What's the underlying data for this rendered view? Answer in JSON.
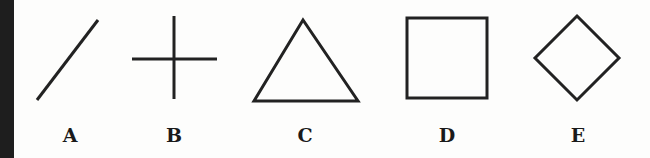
{
  "figure": {
    "stroke_color": "#222222",
    "shapes": [
      {
        "label": "A",
        "shape": "diagonal-line"
      },
      {
        "label": "B",
        "shape": "cross"
      },
      {
        "label": "C",
        "shape": "triangle"
      },
      {
        "label": "D",
        "shape": "square"
      },
      {
        "label": "E",
        "shape": "diamond"
      }
    ]
  }
}
